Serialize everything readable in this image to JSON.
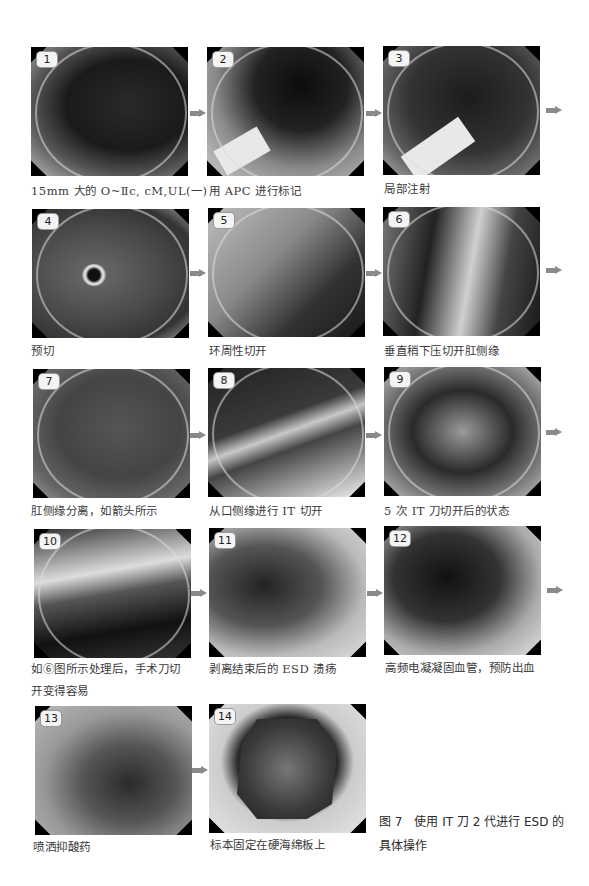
{
  "figure": {
    "label": "图 7",
    "title_line1": "图 7　使用 IT 刀 2 代进行 ESD 的",
    "title_line2": "具体操作"
  },
  "panels": [
    {
      "number": "1",
      "caption": "15mm 大的 O~Ⅱc, cM,UL(一)"
    },
    {
      "number": "2",
      "caption": "用 APC 进行标记"
    },
    {
      "number": "3",
      "caption": "局部注射"
    },
    {
      "number": "4",
      "caption": "预切"
    },
    {
      "number": "5",
      "caption": "环周性切开"
    },
    {
      "number": "6",
      "caption": "垂直稍下压切开肛侧缘"
    },
    {
      "number": "7",
      "caption": "肛侧缘分离，如箭头所示"
    },
    {
      "number": "8",
      "caption": "从口侧缘进行 IT 切开"
    },
    {
      "number": "9",
      "caption": "5 次 IT 刀切开后的状态"
    },
    {
      "number": "10",
      "caption_line1": "如⑥图所示处理后，手术刀切",
      "caption_line2": "开变得容易"
    },
    {
      "number": "11",
      "caption": "剥离结束后的 ESD 溃疡"
    },
    {
      "number": "12",
      "caption": "高频电凝凝固血管，预防出血"
    },
    {
      "number": "13",
      "caption": "喷洒抑酸药"
    },
    {
      "number": "14",
      "caption": "标本固定在硬海绵板上"
    }
  ],
  "icons": {
    "arrow": "right-arrow-icon",
    "arrow_color": "#8a8a8a"
  }
}
